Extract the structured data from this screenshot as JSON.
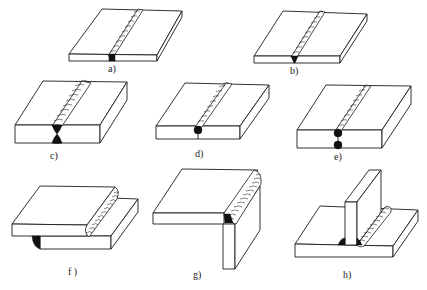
{
  "figure": {
    "type": "weld joint illustrations",
    "panels": [
      {
        "id": "a",
        "label": "a)",
        "description": "square butt joint, single weld bead, full-penetration root"
      },
      {
        "id": "b",
        "label": "b)",
        "description": "butt joint with single-V groove weld"
      },
      {
        "id": "c",
        "label": "c)",
        "description": "butt joint with double-V (X) groove weld, thick plate"
      },
      {
        "id": "d",
        "label": "d)",
        "description": "butt joint, single-side weld with partial penetration"
      },
      {
        "id": "e",
        "label": "e)",
        "description": "butt joint, welded both sides, partial penetration each side"
      },
      {
        "id": "f",
        "label": "f )",
        "description": "lap joint with fillet welds"
      },
      {
        "id": "g",
        "label": "g)",
        "description": "corner joint with outside weld"
      },
      {
        "id": "h",
        "label": "h)",
        "description": "T-joint with fillet welds both sides"
      }
    ]
  },
  "colors": {
    "line": "#1a1a1a",
    "fill": "#ffffff",
    "root": "#111111"
  }
}
